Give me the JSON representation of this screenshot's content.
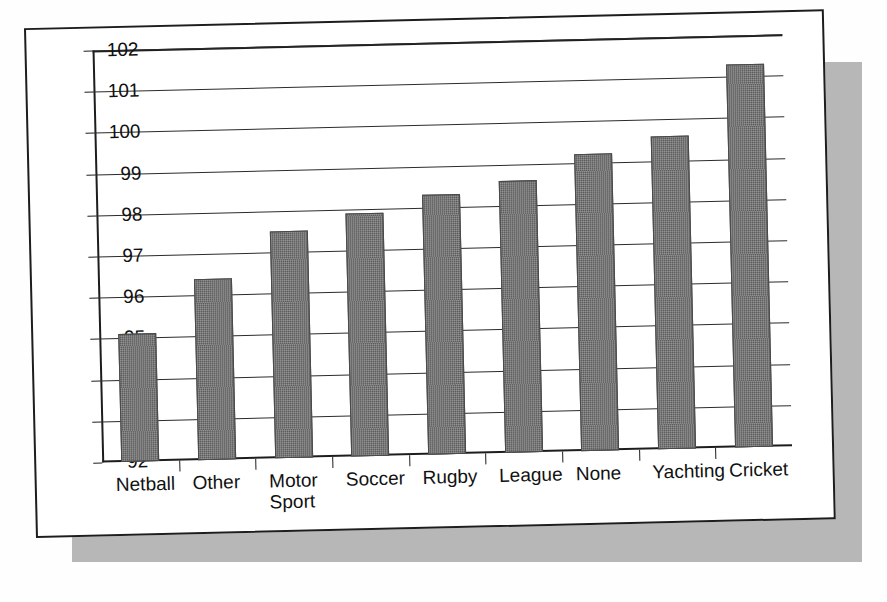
{
  "chart_data": {
    "type": "bar",
    "title": "",
    "subtitle": "",
    "xlabel": "",
    "ylabel": "",
    "grid": true,
    "legend": "none",
    "ylim": [
      92,
      102
    ],
    "ytick_labels": [
      "92",
      "93",
      "94",
      "95",
      "96",
      "97",
      "98",
      "99",
      "100",
      "101",
      "102"
    ],
    "ytick_values": [
      92,
      93,
      94,
      95,
      96,
      97,
      98,
      99,
      100,
      101,
      102
    ],
    "categories": [
      "Netball",
      "Other",
      "Motor\nSport",
      "Soccer",
      "Rugby",
      "League",
      "None",
      "Yachting",
      "Cricket"
    ],
    "values": [
      95.1,
      96.4,
      97.5,
      97.9,
      98.3,
      98.6,
      99.2,
      99.6,
      101.3
    ],
    "bar_color": "#5a5a5a",
    "axis_color": "#1d1d1d",
    "background_color": "#ffffff",
    "shadow_color": "#b7b7b7"
  }
}
